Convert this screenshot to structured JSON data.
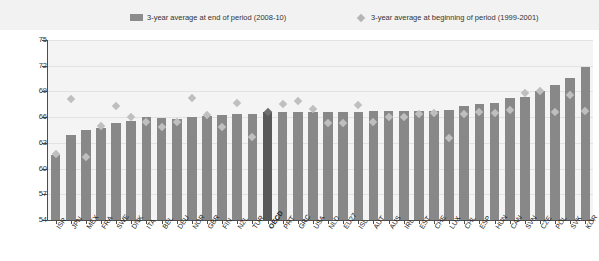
{
  "legend": {
    "entries": [
      {
        "label": "3-year average at end of period (2008-10)",
        "icon": "bar-swatch-icon",
        "color": "#8c8c8c"
      },
      {
        "label": "3-year average at beginning of period (1999-2001)",
        "icon": "diamond-swatch-icon",
        "color": "#b5b5b5"
      }
    ]
  },
  "chart_data": {
    "type": "bar",
    "title": "",
    "subtitle": "",
    "xlabel": "",
    "ylabel": "",
    "ylim": [
      54,
      75
    ],
    "yticks": [
      54,
      57,
      60,
      63,
      66,
      69,
      72,
      75
    ],
    "grid": true,
    "legend_position": "top",
    "categories": [
      "ISR",
      "JPN",
      "MEX",
      "FRA",
      "SWE",
      "DNK",
      "ITA",
      "BEL",
      "DEU",
      "NOR",
      "GBR",
      "FIN",
      "NZL",
      "TUR",
      "OECD",
      "PRT",
      "GRC",
      "USA",
      "NLD",
      "EU27",
      "ISL",
      "AUT",
      "AUS",
      "IRL",
      "EST",
      "CHE",
      "LUX",
      "CHL",
      "ESP",
      "HUN",
      "CAN",
      "SVN",
      "CZE",
      "POL",
      "SVK",
      "KOR"
    ],
    "series": [
      {
        "name": "3-year average at end of period (2008-10)",
        "marker": "bar",
        "color": "#888888",
        "highlight_category": "OECD",
        "highlight_color": "#595959",
        "values": [
          61.6,
          63.9,
          64.5,
          64.7,
          65.3,
          65.5,
          66.0,
          65.9,
          65.8,
          66.0,
          66.1,
          66.3,
          66.4,
          66.4,
          66.6,
          66.6,
          66.6,
          66.6,
          66.6,
          66.6,
          66.6,
          66.7,
          66.7,
          66.7,
          66.7,
          66.7,
          66.8,
          67.3,
          67.5,
          67.7,
          68.2,
          68.4,
          69.0,
          69.7,
          70.6,
          71.9
        ]
      },
      {
        "name": "3-year average at beginning of period (1999-2001)",
        "marker": "diamond",
        "color": "#bfbfbf",
        "highlight_category": "OECD",
        "highlight_color": "#6e6e6e",
        "values": [
          61.7,
          68.1,
          61.3,
          65.0,
          67.3,
          66.0,
          65.4,
          64.8,
          65.4,
          68.2,
          66.3,
          64.8,
          67.7,
          63.7,
          66.6,
          67.5,
          67.9,
          67.0,
          65.3,
          65.3,
          67.4,
          65.4,
          66.0,
          66.0,
          66.4,
          66.5,
          63.6,
          66.4,
          66.6,
          66.5,
          66.8,
          68.8,
          69.1,
          66.6,
          68.6,
          66.7
        ]
      }
    ]
  }
}
